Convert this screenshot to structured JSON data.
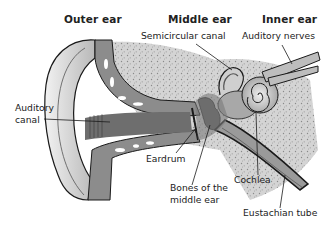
{
  "diagram": {
    "headers": {
      "outer": "Outer ear",
      "middle": "Middle ear",
      "inner": "Inner ear"
    },
    "labels": {
      "semicircular_canal": "Semicircular canal",
      "auditory_nerves": "Auditory nerves",
      "auditory_canal_1": "Auditory",
      "auditory_canal_2": "canal",
      "eardrum": "Eardrum",
      "bones_1": "Bones of the",
      "bones_2": "middle ear",
      "cochlea": "Cochlea",
      "eustachian_tube": "Eustachian tube"
    },
    "colors": {
      "background": "#ffffff",
      "text": "#222222",
      "skin": "#d9d9d9",
      "canal_gray": "#8c8c8c",
      "bone_speckle": "#cfcfcf",
      "outline": "#1a1a1a"
    }
  }
}
